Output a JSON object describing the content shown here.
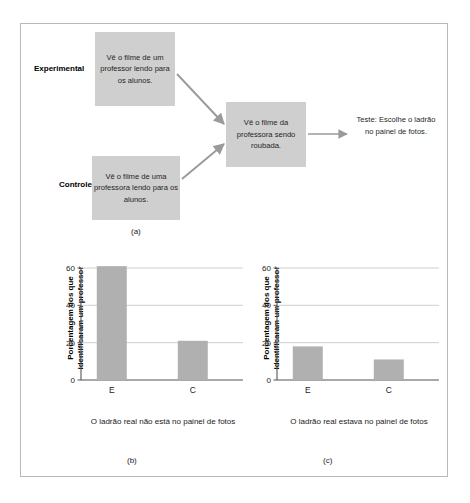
{
  "figure": {
    "panel_a": {
      "letter": "(a)",
      "group_labels": {
        "experimental": "Experimental",
        "control": "Controle"
      },
      "boxes": {
        "experimental_stimulus": "Vê o filme de um professor lendo para os alunos.",
        "control_stimulus": "Vê o filme de uma professora lendo para os alunos.",
        "theft_film": "Vê o filme da professora sendo roubada."
      },
      "test_text": "Teste: Escolhe o ladrão no painel de fotos."
    },
    "panel_b": {
      "letter": "(b)"
    },
    "panel_c": {
      "letter": "(c)"
    }
  },
  "chart_data": [
    {
      "type": "bar",
      "panel": "(b)",
      "title": "",
      "categories": [
        "E",
        "C"
      ],
      "values": [
        61,
        21
      ],
      "ylabel": "Porcentagem dos que identificaram um professor",
      "xlabel": "O ladrão real não está no painel de fotos",
      "ylim": [
        0,
        60
      ],
      "yticks": [
        0,
        20,
        40,
        60
      ],
      "ytick_labels": [
        "0",
        "20",
        "40",
        "60"
      ],
      "grid": true,
      "legend": "none",
      "bar_color": "#b0b0b0"
    },
    {
      "type": "bar",
      "panel": "(c)",
      "title": "",
      "categories": [
        "E",
        "C"
      ],
      "values": [
        18,
        11
      ],
      "ylabel": "Porcentagem dos que identificaram um professor",
      "xlabel": "O ladrão real estava no painel de fotos",
      "ylim": [
        0,
        60
      ],
      "yticks": [
        0,
        20,
        40,
        60
      ],
      "ytick_labels": [
        "0",
        "20",
        "40",
        "60"
      ],
      "grid": true,
      "legend": "none",
      "bar_color": "#b0b0b0"
    }
  ]
}
